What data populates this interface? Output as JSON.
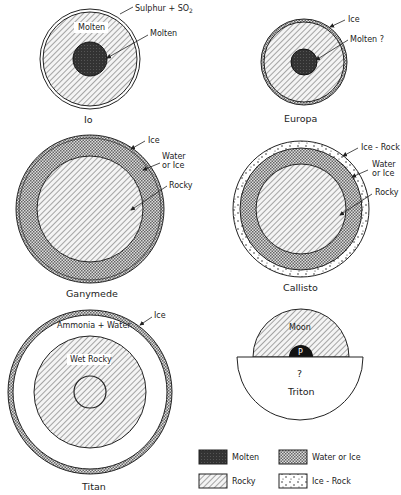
{
  "figure": {
    "moons": [
      {
        "name": "Io",
        "labels": {
          "crust": "Sulphur + SO",
          "crust_sub": "2",
          "mantle": "Molten",
          "core": "Molten"
        }
      },
      {
        "name": "Europa",
        "labels": {
          "crust": "Ice",
          "core": "Molten ?"
        }
      },
      {
        "name": "Ganymede",
        "labels": {
          "crust": "Ice",
          "mantle": "Water",
          "mantle2": "or Ice",
          "core": "Rocky"
        }
      },
      {
        "name": "Callisto",
        "labels": {
          "crust": "Ice - Rock",
          "mantle": "Water",
          "mantle2": "or Ice",
          "core": "Rocky"
        }
      },
      {
        "name": "Titan",
        "labels": {
          "crust": "Ice",
          "mantle": "Ammonia + Water",
          "core": "Wet Rocky"
        }
      },
      {
        "name": "Triton",
        "labels": {
          "upper": "Moon",
          "core": "P",
          "lower": "?"
        }
      }
    ],
    "legend": [
      {
        "pattern": "molten",
        "label": "Molten"
      },
      {
        "pattern": "water-or-ice",
        "label": "Water or Ice"
      },
      {
        "pattern": "rocky",
        "label": "Rocky"
      },
      {
        "pattern": "ice-rock",
        "label": "Ice - Rock"
      }
    ]
  }
}
